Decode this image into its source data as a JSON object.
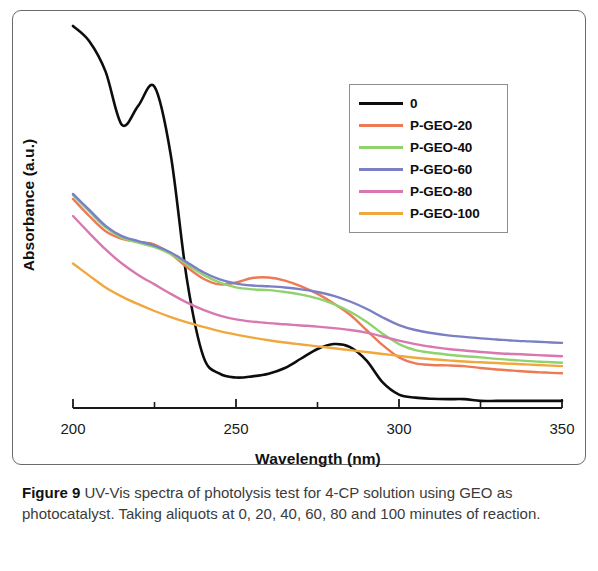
{
  "figure": {
    "caption_label": "Figure 9",
    "caption_text": " UV-Vis spectra of photolysis test for 4-CP solution using GEO as photocatalyst. Taking aliquots at 0, 20, 40, 60, 80 and 100 minutes of reaction."
  },
  "chart_data": {
    "type": "line",
    "title": "",
    "xlabel": "Wavelength (nm)",
    "ylabel": "Absorbance (a.u.)",
    "xlim": [
      200,
      350
    ],
    "ylim": [
      0,
      1
    ],
    "xticks": [
      200,
      250,
      300,
      350
    ],
    "xtick_labels": [
      "200",
      "250",
      "300",
      "350"
    ],
    "minor_xticks": [
      225,
      275,
      325
    ],
    "yticks": [],
    "ytick_labels": [],
    "grid": false,
    "legend_position": "upper right",
    "x": [
      200,
      205,
      210,
      215,
      220,
      225,
      230,
      235,
      240,
      245,
      250,
      255,
      260,
      265,
      270,
      275,
      280,
      285,
      290,
      295,
      300,
      305,
      310,
      315,
      320,
      325,
      330,
      335,
      340,
      345,
      350
    ],
    "series": [
      {
        "name": "0",
        "label": "0",
        "color": "#0d0d0d",
        "values": [
          1.0,
          0.96,
          0.88,
          0.74,
          0.79,
          0.84,
          0.66,
          0.33,
          0.13,
          0.085,
          0.075,
          0.078,
          0.085,
          0.1,
          0.125,
          0.15,
          0.163,
          0.155,
          0.12,
          0.062,
          0.03,
          0.022,
          0.019,
          0.018,
          0.018,
          0.0135,
          0.0135,
          0.0135,
          0.0135,
          0.0135,
          0.0135
        ]
      },
      {
        "name": "P-GEO-20",
        "label": "P-GEO-20",
        "color": "#ee7a55",
        "values": [
          0.545,
          0.5,
          0.46,
          0.44,
          0.432,
          0.425,
          0.4,
          0.365,
          0.335,
          0.32,
          0.325,
          0.337,
          0.338,
          0.33,
          0.315,
          0.295,
          0.27,
          0.24,
          0.2,
          0.16,
          0.128,
          0.112,
          0.108,
          0.107,
          0.105,
          0.1,
          0.096,
          0.093,
          0.09,
          0.088,
          0.086
        ]
      },
      {
        "name": "P-GEO-40",
        "label": "P-GEO-40",
        "color": "#8ed36e",
        "values": [
          0.555,
          0.512,
          0.47,
          0.443,
          0.43,
          0.418,
          0.4,
          0.372,
          0.345,
          0.325,
          0.312,
          0.307,
          0.305,
          0.3,
          0.293,
          0.283,
          0.268,
          0.248,
          0.222,
          0.19,
          0.163,
          0.147,
          0.14,
          0.135,
          0.131,
          0.128,
          0.124,
          0.121,
          0.118,
          0.116,
          0.114
        ]
      },
      {
        "name": "P-GEO-60",
        "label": "P-GEO-60",
        "color": "#7b7fc4",
        "values": [
          0.558,
          0.516,
          0.474,
          0.447,
          0.434,
          0.422,
          0.404,
          0.378,
          0.352,
          0.333,
          0.322,
          0.317,
          0.315,
          0.312,
          0.307,
          0.3,
          0.29,
          0.275,
          0.256,
          0.233,
          0.213,
          0.2,
          0.192,
          0.186,
          0.182,
          0.178,
          0.175,
          0.172,
          0.17,
          0.168,
          0.166
        ]
      },
      {
        "name": "P-GEO-80",
        "label": "P-GEO-80",
        "color": "#d978b0",
        "values": [
          0.5,
          0.455,
          0.412,
          0.375,
          0.345,
          0.32,
          0.295,
          0.272,
          0.253,
          0.238,
          0.228,
          0.222,
          0.218,
          0.215,
          0.212,
          0.209,
          0.205,
          0.2,
          0.193,
          0.183,
          0.172,
          0.163,
          0.156,
          0.15,
          0.146,
          0.142,
          0.139,
          0.137,
          0.135,
          0.133,
          0.131
        ]
      },
      {
        "name": "P-GEO-100",
        "label": "P-GEO-100",
        "color": "#f0a83e",
        "values": [
          0.375,
          0.343,
          0.312,
          0.288,
          0.268,
          0.25,
          0.234,
          0.22,
          0.208,
          0.197,
          0.188,
          0.18,
          0.173,
          0.167,
          0.162,
          0.157,
          0.152,
          0.147,
          0.142,
          0.137,
          0.132,
          0.127,
          0.123,
          0.12,
          0.117,
          0.115,
          0.113,
          0.111,
          0.109,
          0.107,
          0.105
        ]
      }
    ]
  },
  "legend": {
    "entries": [
      {
        "label": "0",
        "color": "#0d0d0d"
      },
      {
        "label": "P-GEO-20",
        "color": "#ee7a55"
      },
      {
        "label": "P-GEO-40",
        "color": "#8ed36e"
      },
      {
        "label": "P-GEO-60",
        "color": "#7b7fc4"
      },
      {
        "label": "P-GEO-80",
        "color": "#d978b0"
      },
      {
        "label": "P-GEO-100",
        "color": "#f0a83e"
      }
    ]
  }
}
